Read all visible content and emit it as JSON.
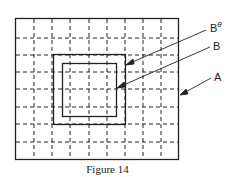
{
  "figure": {
    "caption": "Figure 14",
    "labels": {
      "b_theta": "B",
      "b_theta_sup": "θ",
      "b": "B",
      "a": "A"
    }
  }
}
